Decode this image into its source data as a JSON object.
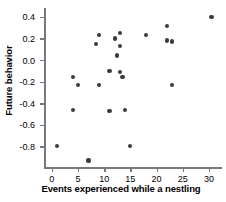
{
  "chart_data": {
    "type": "scatter",
    "title": "",
    "xlabel": "Events experienced while a nestling",
    "ylabel": "Future behavior",
    "xlim": [
      -1.5,
      32.5
    ],
    "ylim": [
      -1.0,
      0.48
    ],
    "xticks": [
      0,
      5,
      10,
      15,
      20,
      25,
      30
    ],
    "xtick_labels": [
      "0",
      "5",
      "10",
      "15",
      "20",
      "25",
      "30"
    ],
    "yticks": [
      0.4,
      0.2,
      0.0,
      -0.2,
      -0.4,
      -0.6,
      -0.8
    ],
    "ytick_labels": [
      "0.4",
      "0.2",
      "0.0",
      "-0.2",
      "-0.4",
      "-0.6",
      "-0.8"
    ],
    "grid": false,
    "legend": null,
    "marker_color": "#3b3b3d",
    "axis_color": "#77787b",
    "points": [
      {
        "x": 1,
        "y": -0.8
      },
      {
        "x": 4,
        "y": -0.16
      },
      {
        "x": 4,
        "y": -0.46
      },
      {
        "x": 5,
        "y": -0.23
      },
      {
        "x": 7,
        "y": -0.93
      },
      {
        "x": 8.5,
        "y": 0.15
      },
      {
        "x": 9,
        "y": 0.23
      },
      {
        "x": 9,
        "y": -0.23
      },
      {
        "x": 11,
        "y": -0.1
      },
      {
        "x": 11,
        "y": -0.47
      },
      {
        "x": 12,
        "y": 0.19
      },
      {
        "x": 12,
        "y": 0.2
      },
      {
        "x": 12.5,
        "y": 0.04
      },
      {
        "x": 13,
        "y": 0.25
      },
      {
        "x": 13,
        "y": 0.13
      },
      {
        "x": 13,
        "y": -0.11
      },
      {
        "x": 13.5,
        "y": -0.16
      },
      {
        "x": 14,
        "y": -0.46
      },
      {
        "x": 15,
        "y": -0.8
      },
      {
        "x": 18,
        "y": 0.23
      },
      {
        "x": 22,
        "y": 0.31
      },
      {
        "x": 22,
        "y": 0.18
      },
      {
        "x": 23,
        "y": 0.17
      },
      {
        "x": 23,
        "y": -0.23
      },
      {
        "x": 30.5,
        "y": 0.4
      }
    ]
  }
}
